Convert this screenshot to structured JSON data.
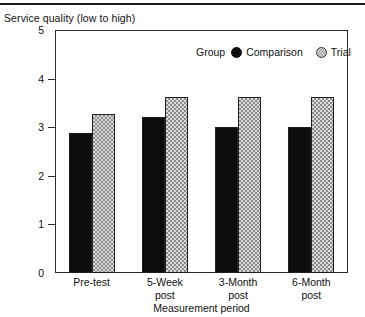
{
  "figure": {
    "title": "Service quality (low to high)",
    "top_rule": true
  },
  "legend": {
    "title": "Group",
    "entries": [
      {
        "label": "Comparison",
        "marker": "filled-circle-icon",
        "color": "#0d0d0d"
      },
      {
        "label": "Trial",
        "marker": "dotted-circle-icon",
        "color": "#d8d8d8"
      }
    ]
  },
  "axes": {
    "x_title": "Measurement period",
    "y_ticks": [
      "5",
      "4",
      "3",
      "2",
      "1",
      "0"
    ]
  },
  "chart_data": {
    "type": "bar",
    "title": "Service quality (low to high)",
    "xlabel": "Measurement period",
    "ylabel": "Service quality (low to high)",
    "ylim": [
      0,
      5
    ],
    "yticks": [
      0,
      1,
      2,
      3,
      4,
      5
    ],
    "grid": false,
    "legend_position": "top-right-inside",
    "legend_title": "Group",
    "categories": [
      "Pre-test",
      "5-Week post",
      "3-Month post",
      "6-Month post"
    ],
    "category_lines": [
      [
        "Pre-test"
      ],
      [
        "5-Week",
        "post"
      ],
      [
        "3-Month",
        "post"
      ],
      [
        "6-Month",
        "post"
      ]
    ],
    "series": [
      {
        "name": "Comparison",
        "color": "#0d0d0d",
        "fill": "solid-black",
        "values": [
          2.88,
          3.22,
          3.0,
          3.0
        ]
      },
      {
        "name": "Trial",
        "color": "#d8d8d8",
        "fill": "light-checkered",
        "values": [
          3.28,
          3.62,
          3.62,
          3.62
        ]
      }
    ]
  }
}
